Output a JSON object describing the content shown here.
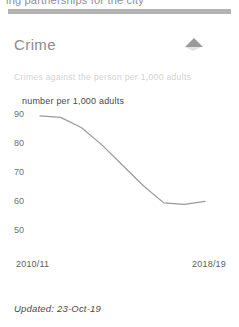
{
  "clipped_text": "ing partnerships for the city",
  "card": {
    "title": "Crime",
    "subtitle": "Crimes against the person per 1,000 adults",
    "collapse_icon": "triangle-up-icon",
    "updated": "Updated: 23-Oct-19"
  },
  "chart_data": {
    "type": "line",
    "title": "Crime",
    "subtitle": "Crimes against the person per 1,000 adults",
    "ylabel": "number per 1,000 adults",
    "xlabel": "",
    "ylim": [
      45,
      92
    ],
    "yticks": [
      90,
      80,
      70,
      60,
      50
    ],
    "ytick_labels": [
      "90",
      "80",
      "70",
      "60",
      "50"
    ],
    "xticks": [
      "2010/11",
      "2018/19"
    ],
    "xtick_labels": [
      "2010/11",
      "2018/19"
    ],
    "grid": false,
    "legend": false,
    "line_color": "#9a9a9a",
    "categories": [
      "2010/11",
      "2011/12",
      "2012/13",
      "2013/14",
      "2014/15",
      "2015/16",
      "2016/17",
      "2017/18",
      "2018/19"
    ],
    "values": [
      89,
      88.5,
      85,
      79,
      72,
      65,
      59,
      58.5,
      59.5
    ]
  }
}
